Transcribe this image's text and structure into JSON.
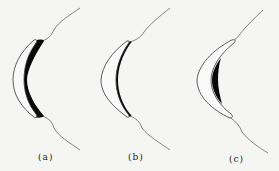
{
  "figure": {
    "panels": [
      {
        "id": "a",
        "label": "(a)",
        "description": "crescent lens with dark region filling inner side against profile line"
      },
      {
        "id": "b",
        "label": "(b)",
        "description": "crescent lens with narrow dark band along inner edge"
      },
      {
        "id": "c",
        "label": "(c)",
        "description": "crescent lens with dark crescent inside, gap from profile"
      }
    ],
    "colors": {
      "background": "#f5f5f4",
      "line": "#555555",
      "fill_dark": "#0a0a0a"
    }
  }
}
